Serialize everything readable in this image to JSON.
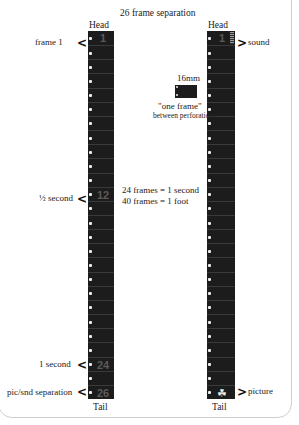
{
  "title": "26 frame separation",
  "left_strip": {
    "head_label": "Head",
    "tail_label": "Tail",
    "frame_count": 26,
    "markers": [
      {
        "label": "frame 1",
        "frame": "1"
      },
      {
        "label": "½ second",
        "frame": "12"
      },
      {
        "label": "1 second",
        "frame": "24"
      },
      {
        "label": "pic/snd separation",
        "frame": "26"
      }
    ]
  },
  "right_strip": {
    "head_label": "Head",
    "tail_label": "Tail",
    "frame_count": 26,
    "markers": [
      {
        "label": "sound",
        "frame": "1"
      },
      {
        "label": "picture",
        "frame": "26"
      }
    ]
  },
  "inset": {
    "gauge": "16mm",
    "caption_line1": "\"one frame\"",
    "caption_line2": "between perforations"
  },
  "facts": {
    "line1": "24 frames = 1 second",
    "line2": "40 frames =  1 foot"
  },
  "icons": {
    "left_arrow": "chevron-left-icon",
    "right_arrow": "chevron-right-icon",
    "picture_frame": "figure-icon"
  },
  "colors": {
    "film": "#1c1c1c",
    "perforation": "#eeeeee",
    "frame_number": "#5a5a5a"
  }
}
